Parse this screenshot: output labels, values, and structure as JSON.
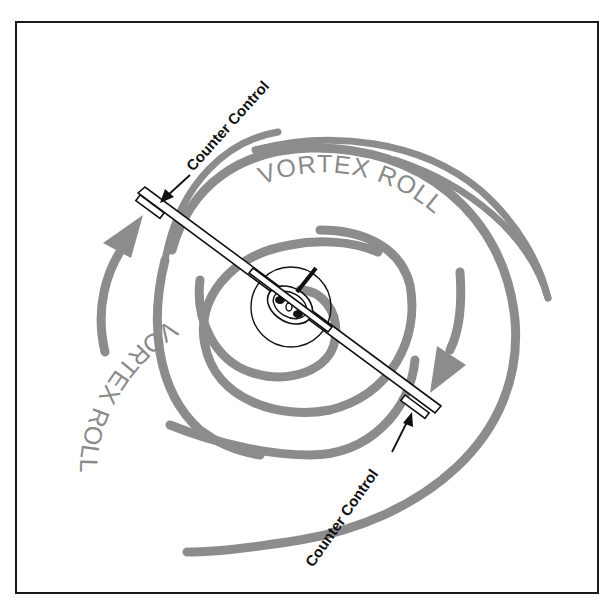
{
  "diagram": {
    "labels": {
      "vortex_roll_top": "VORTEX ROLL",
      "vortex_roll_left": "VORTEX ROLL",
      "counter_control_top": "Counter Control",
      "counter_control_bottom": "Counter Control"
    },
    "colors": {
      "swirl": "#8c8c8c",
      "outline": "#111111",
      "background": "#ffffff"
    },
    "elements": [
      {
        "name": "frame",
        "type": "rectangle"
      },
      {
        "name": "vortex-spiral",
        "type": "swirl",
        "direction": "clockwise"
      },
      {
        "name": "aircraft",
        "type": "rear-view-airplane",
        "attitude": "banked"
      },
      {
        "name": "counter-control-arrow-left-wing",
        "points_to": "left aileron"
      },
      {
        "name": "counter-control-arrow-right-wing",
        "points_to": "right aileron"
      }
    ]
  }
}
